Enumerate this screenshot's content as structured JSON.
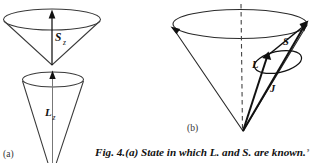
{
  "figure": {
    "caption_lead": "Fig. 4.",
    "caption_body": "(a) State in which L. and S. are known.",
    "caption_tail": "’",
    "panels": [
      {
        "id": "a",
        "label": "(a)",
        "cones": [
          {
            "name": "spin-cone",
            "vector_label": "S",
            "vector_subscript": "z"
          },
          {
            "name": "orbital-cone",
            "vector_label": "L",
            "vector_subscript": "z"
          }
        ]
      },
      {
        "id": "b",
        "label": "(b)",
        "vectors": [
          {
            "name": "total-angular-momentum",
            "label": "J"
          },
          {
            "name": "orbital-angular-momentum",
            "label": "L"
          },
          {
            "name": "spin-angular-momentum",
            "label": "S"
          }
        ]
      }
    ],
    "colors": {
      "ink": "#111111",
      "line": "#3a3a3a",
      "background": "#ffffff",
      "panel_label": "#333333"
    }
  }
}
